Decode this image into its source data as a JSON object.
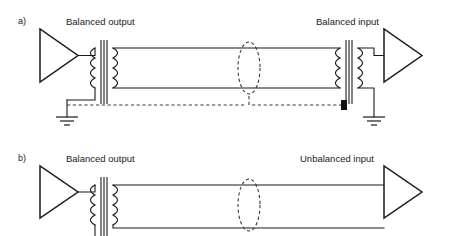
{
  "figure": {
    "caption_present": false,
    "background_color": "#ffffff",
    "line_color": "#1a1a1a",
    "shield_color": "#3a3a3a",
    "terminator_color": "#111111"
  },
  "panels": [
    {
      "id": "panel-a",
      "label": "a)",
      "source_label": "Balanced output",
      "dest_label": "Balanced input",
      "source_device": "amplifier-triangle",
      "dest_device": "amplifier-triangle",
      "source_transformer": "output-transformer",
      "dest_transformer": "input-transformer",
      "signal_conductors": 2,
      "shield": {
        "style": "dashed",
        "grounded_end": "source",
        "open_end": "destination",
        "open_end_marker": "black-block"
      },
      "grounds": [
        "source-ground",
        "destination-ground"
      ]
    },
    {
      "id": "panel-b",
      "label": "b)",
      "source_label": "Balanced output",
      "dest_label": "Unbalanced input",
      "source_device": "amplifier-triangle",
      "dest_device": "amplifier-triangle",
      "source_transformer": "output-transformer",
      "dest_transformer": null,
      "signal_conductors": 2,
      "shield": {
        "style": "dashed",
        "grounded_end": "none",
        "open_end": "none",
        "open_end_marker": null
      },
      "grounds": []
    }
  ],
  "icons": {
    "amplifier": "amplifier-triangle-icon",
    "transformer": "transformer-icon",
    "ground": "ground-symbol-icon",
    "shield_ellipse": "cable-shield-ellipse-icon",
    "terminator": "shield-terminator-block-icon"
  }
}
